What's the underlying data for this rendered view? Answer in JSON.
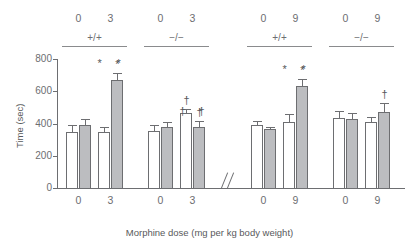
{
  "chart_data": {
    "type": "bar",
    "title": "",
    "xlabel": "Morphine dose (mg per kg body weight)",
    "ylabel": "Time (sec)",
    "ylim": [
      0,
      800
    ],
    "yticks": [
      0,
      200,
      400,
      600,
      800
    ],
    "ytick_labels": [
      "0",
      "200",
      "400",
      "600",
      "800"
    ],
    "grid": false,
    "legend": "none",
    "axis_break": true,
    "axis_break_symbol": "//",
    "bar_colors": {
      "untreated": "#ffffff",
      "treated": "#bcbdc0"
    },
    "groups": [
      {
        "genotype": "+/+",
        "dose_labels": [
          "0",
          "3"
        ],
        "bars": [
          {
            "value": 350,
            "error": 38,
            "fill": "white",
            "annotation": ""
          },
          {
            "value": 388,
            "error": 40,
            "fill": "gray",
            "annotation": ""
          },
          {
            "value": 348,
            "error": 33,
            "fill": "white",
            "annotation": ""
          },
          {
            "value": 668,
            "error": 47,
            "fill": "gray",
            "annotation": "*"
          }
        ],
        "group_annotations": [
          "*",
          "*"
        ]
      },
      {
        "genotype": "−/−",
        "dose_labels": [
          "0",
          "3"
        ],
        "bars": [
          {
            "value": 353,
            "error": 38,
            "fill": "white",
            "annotation": ""
          },
          {
            "value": 378,
            "error": 33,
            "fill": "gray",
            "annotation": ""
          },
          {
            "value": 465,
            "error": 27,
            "fill": "white",
            "annotation": "†"
          },
          {
            "value": 380,
            "error": 35,
            "fill": "gray",
            "annotation": "†"
          }
        ],
        "group_annotations": [
          "†",
          "†"
        ]
      },
      {
        "genotype": "+/+",
        "dose_labels": [
          "0",
          "9"
        ],
        "bars": [
          {
            "value": 390,
            "error": 23,
            "fill": "white",
            "annotation": ""
          },
          {
            "value": 363,
            "error": 13,
            "fill": "gray",
            "annotation": ""
          },
          {
            "value": 412,
            "error": 45,
            "fill": "white",
            "annotation": ""
          },
          {
            "value": 630,
            "error": 48,
            "fill": "gray",
            "annotation": "*"
          }
        ],
        "group_annotations": [
          "*",
          "*"
        ]
      },
      {
        "genotype": "−/−",
        "dose_labels": [
          "0",
          "9"
        ],
        "bars": [
          {
            "value": 437,
            "error": 38,
            "fill": "white",
            "annotation": ""
          },
          {
            "value": 430,
            "error": 33,
            "fill": "gray",
            "annotation": ""
          },
          {
            "value": 410,
            "error": 32,
            "fill": "white",
            "annotation": ""
          },
          {
            "value": 470,
            "error": 57,
            "fill": "gray",
            "annotation": "†"
          }
        ],
        "group_annotations": [
          "†"
        ]
      }
    ]
  },
  "axes": {
    "y_title": "Time (sec)",
    "x_title": "Morphine dose (mg per kg body weight)",
    "y_tick_labels": [
      "800",
      "600",
      "400",
      "200",
      "0"
    ],
    "x_tick_labels": [
      "0",
      "3",
      "0",
      "3",
      "0",
      "9",
      "0",
      "9"
    ],
    "top_dose_labels": [
      "0",
      "3",
      "0",
      "3",
      "0",
      "9",
      "0",
      "9"
    ],
    "genotype_labels": [
      "+/+",
      "−/−",
      "+/+",
      "−/−"
    ]
  }
}
